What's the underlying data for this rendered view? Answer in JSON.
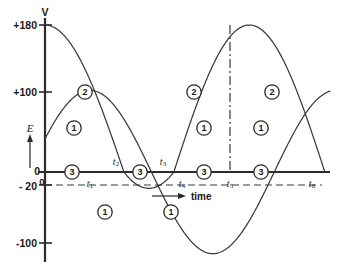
{
  "chart_data": {
    "type": "line",
    "title": "",
    "xlabel": "time",
    "ylabel": "V",
    "axis_symbol_left": "E",
    "origin_label": "0",
    "grid": false,
    "legend": "inline-circled-markers",
    "ylim": [
      -120,
      195
    ],
    "xlim": [
      0,
      1
    ],
    "y_ticks": [
      {
        "label": "+180",
        "value": 180
      },
      {
        "label": "+100",
        "value": 100
      },
      {
        "label": "0",
        "value": 0
      },
      {
        "label": "- 20",
        "value": -20
      },
      {
        "label": "-100",
        "value": -100
      }
    ],
    "x_ticks": [
      {
        "label": "t",
        "sub": "1",
        "value": 0.158
      },
      {
        "label": "t",
        "sub": "2",
        "value": 0.277
      },
      {
        "label": "t",
        "sub": "3",
        "value": 0.452
      },
      {
        "label": "t",
        "sub": "4",
        "value": 0.589
      },
      {
        "label": "t",
        "sub": "5",
        "value": 0.758
      },
      {
        "label": "t",
        "sub": "6",
        "value": 0.982
      }
    ],
    "guides": [
      {
        "name": "minus-20-dashed",
        "orientation": "horizontal",
        "value": -20,
        "style": "dashed"
      },
      {
        "name": "t5-peak-dashdot",
        "orientation": "vertical",
        "value": 0.758,
        "style": "dash-dot"
      }
    ],
    "series": [
      {
        "name": "curve-1",
        "marker_label": "1",
        "amplitude": 100,
        "offset": 0,
        "description": "sinusoid starting at +100, falling through zero at t1, minimum -100, rising through zero at t4, peak +100 at t5"
      },
      {
        "name": "curve-2",
        "marker_label": "2",
        "amplitude": 180,
        "offset": 0,
        "description": "sinusoid starting at +180, falling through zero at t2, shallow minimum -20, rising through zero at t3, peak +180 at t5, falling to zero at t6"
      },
      {
        "name": "curve-3",
        "marker_label": "3",
        "amplitude": 0,
        "offset": 0,
        "description": "flat zero-volt reference line along the time axis"
      }
    ],
    "markers": [
      {
        "label": "2",
        "x": 0.1055,
        "y": 100
      },
      {
        "label": "1",
        "x": 0.0735,
        "y": 36
      },
      {
        "label": "3",
        "x": 0.1205,
        "y": 0
      },
      {
        "label": "3",
        "x": 0.3595,
        "y": 0
      },
      {
        "label": "1",
        "x": 0.217,
        "y": -67
      },
      {
        "label": "1",
        "x": 0.4645,
        "y": -67
      },
      {
        "label": "2",
        "x": 0.5925,
        "y": 100
      },
      {
        "label": "1",
        "x": 0.6275,
        "y": 36
      },
      {
        "label": "3",
        "x": 0.6555,
        "y": 0
      },
      {
        "label": "3",
        "x": 0.8565,
        "y": 0
      },
      {
        "label": "2",
        "x": 0.8925,
        "y": 100
      },
      {
        "label": "1",
        "x": 0.8225,
        "y": 36
      }
    ]
  },
  "labels": {
    "y_axis_symbol": "V",
    "e_symbol": "E",
    "time_axis": "time",
    "origin": "0"
  }
}
